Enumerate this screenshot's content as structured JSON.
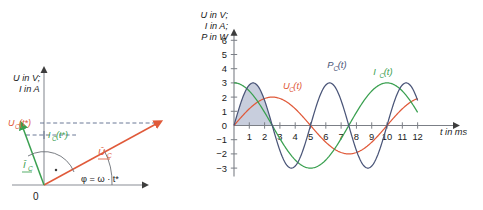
{
  "figure": {
    "background": "#ffffff",
    "colors": {
      "axis": "#7b7f86",
      "voltage": "#e05a3a",
      "current": "#3aa050",
      "power": "#4a5578",
      "power_fill": "#b9c0d4",
      "text": "#1a1a1a"
    }
  },
  "phasor_diagram": {
    "name": "phasor-diagram",
    "axis_label_line1": "U in V;",
    "axis_label_line2": "I in A",
    "origin_label": "0",
    "angle_label": "φ = ω · t*",
    "voltage_phasor_label": "Û",
    "voltage_phasor_sub": "C",
    "current_phasor_label": "Î",
    "current_phasor_sub": "C",
    "voltage_projection_label": "U",
    "voltage_projection_sub": "C",
    "voltage_projection_arg": "(t*)",
    "current_projection_label": "I",
    "current_projection_sub": "C",
    "current_projection_arg": "(t*)",
    "caption": ""
  },
  "chart_data": {
    "type": "line",
    "title": "",
    "ylabel_line1": "U in V;",
    "ylabel_line2": "I in A;",
    "ylabel_line3": "P in W",
    "xlabel": "t in ms",
    "xlim": [
      0,
      13.2
    ],
    "ylim": [
      -3.6,
      6.4
    ],
    "grid": false,
    "xticks": [
      1,
      2,
      3,
      4,
      5,
      6,
      7,
      8,
      9,
      10,
      11,
      12
    ],
    "xticklabels": [
      "1",
      "2",
      "3",
      "4",
      "5",
      "6",
      "7",
      "8",
      "9",
      "10",
      "11",
      "12"
    ],
    "yticks": [
      6,
      5,
      4,
      3,
      2,
      1,
      0,
      -1,
      -2,
      -3
    ],
    "yticklabels": [
      "6",
      "5",
      "4",
      "3",
      "2",
      "1",
      "0",
      "−1",
      "−2",
      "−3"
    ],
    "period_ms": 10,
    "shaded_region": {
      "label": "energy-area",
      "from": 0.0,
      "to": 2.5,
      "series": "P_C(t)",
      "fill": "#b9c0d4"
    },
    "series": [
      {
        "name": "U_C(t)",
        "label": "U",
        "label_sub": "C",
        "label_arg": "(t)",
        "color": "#e05a3a",
        "form": "amplitude * sin(2*pi*t/10)",
        "amplitude": 2.0,
        "phase_deg": 0,
        "label_pos": {
          "t": 3.2,
          "v": 2.55
        },
        "values_at_ticks": [
          1.18,
          1.9,
          1.9,
          1.18,
          0.0,
          -1.18,
          -1.9,
          -1.9,
          -1.18,
          0.0,
          1.18,
          1.9
        ]
      },
      {
        "name": "I_C(t)",
        "label": "I",
        "label_sub": "C",
        "label_arg": "(t)",
        "color": "#3aa050",
        "form": "amplitude * cos(2*pi*t/10)",
        "amplitude": 3.0,
        "phase_deg": 90,
        "label_pos": {
          "t": 9.1,
          "v": 3.55
        },
        "values_at_ticks": [
          2.43,
          0.93,
          -0.93,
          -2.43,
          -3.0,
          -2.43,
          -0.93,
          0.93,
          2.43,
          3.0,
          2.43,
          0.93
        ]
      },
      {
        "name": "P_C(t)",
        "label": "P",
        "label_sub": "C",
        "label_arg": "(t)",
        "color": "#4a5578",
        "form": "amplitude * sin(4*pi*t/10)",
        "amplitude": 3.0,
        "phase_deg": 0,
        "label_pos": {
          "t": 6.1,
          "v": 4.05
        },
        "values_at_ticks": [
          1.76,
          2.85,
          2.85,
          1.76,
          0.0,
          -1.76,
          -2.85,
          -2.85,
          -1.76,
          0.0,
          1.76,
          2.85
        ]
      }
    ]
  }
}
